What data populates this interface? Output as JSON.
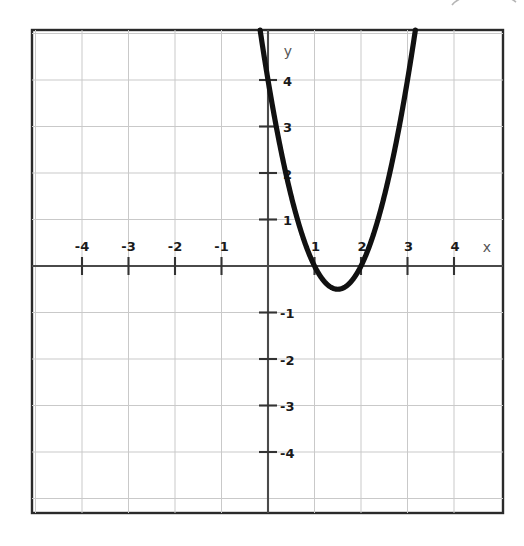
{
  "figure": {
    "background_color": "#ffffff",
    "frame_color": "#2a2a2a",
    "grid_color": "#c9c9c9",
    "axis_color": "#4a4a4a",
    "curve_color": "#111111"
  },
  "axes": {
    "x_axis_label": "x",
    "y_axis_label": "y",
    "x_tick_labels": [
      "-4",
      "-3",
      "-2",
      "-1",
      "1",
      "2",
      "3",
      "4"
    ],
    "y_tick_labels": [
      "4",
      "3",
      "2",
      "1",
      "-1",
      "-2",
      "-3",
      "-4"
    ]
  },
  "chart_data": {
    "type": "line",
    "title": "",
    "subtitle": "",
    "xlabel": "x",
    "ylabel": "y",
    "xlim": [
      -5,
      5
    ],
    "ylim": [
      -5,
      5
    ],
    "xticks": [
      -4,
      -3,
      -2,
      -1,
      1,
      2,
      3,
      4
    ],
    "yticks": [
      4,
      3,
      2,
      1,
      -1,
      -2,
      -3,
      -4
    ],
    "grid": true,
    "legend": "none",
    "annotations": [],
    "series": [
      {
        "name": "parabola",
        "equation": "y = 2x^2 - 6x + 4",
        "roots": [
          1,
          2
        ],
        "vertex": [
          1.5,
          -0.5
        ],
        "y_intercept": 2,
        "color": "#111111",
        "x": [
          -0.45,
          -0.3,
          -0.15,
          0,
          0.25,
          0.5,
          0.75,
          1,
          1.25,
          1.5,
          1.75,
          2,
          2.25,
          2.5,
          2.75,
          3,
          3.25,
          3.5,
          3.75,
          3.95
        ],
        "values": [
          7.1,
          5.98,
          4.945,
          4,
          2.625,
          1.5,
          0.625,
          0,
          -0.375,
          -0.5,
          -0.375,
          0,
          0.625,
          1.5,
          2.625,
          4,
          5.625,
          7.5,
          9.625,
          11.52
        ]
      }
    ]
  }
}
